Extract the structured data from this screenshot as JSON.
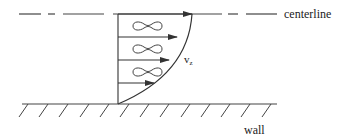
{
  "diagram": {
    "type": "velocity-profile",
    "labels": {
      "centerline": "centerline",
      "velocity_main": "v",
      "velocity_sub": "z",
      "wall": "wall"
    },
    "colors": {
      "stroke": "#333333",
      "text": "#222222",
      "background": "#ffffff"
    },
    "velocity_arrows": [
      {
        "y": 14,
        "length_to": 192
      },
      {
        "y": 37,
        "length_to": 177
      },
      {
        "y": 60,
        "length_to": 169
      },
      {
        "y": 83,
        "length_to": 154
      }
    ],
    "eddies_count": 3,
    "wall_hatch_count": 13
  }
}
